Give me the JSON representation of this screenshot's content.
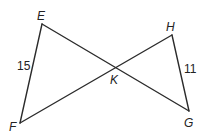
{
  "diagram": {
    "type": "two triangles sharing vertex K (bowtie)",
    "points": {
      "E": {
        "label": "E",
        "x": 42,
        "y": 24
      },
      "F": {
        "label": "F",
        "x": 20,
        "y": 123
      },
      "H": {
        "label": "H",
        "x": 172,
        "y": 35
      },
      "G": {
        "label": "G",
        "x": 189,
        "y": 111
      },
      "K": {
        "label": "K",
        "x": 115,
        "y": 67
      }
    },
    "segments": [
      {
        "from": "E",
        "to": "F",
        "length_label": "15"
      },
      {
        "from": "H",
        "to": "G",
        "length_label": "11"
      },
      {
        "from": "E",
        "to": "G",
        "length_label": ""
      },
      {
        "from": "F",
        "to": "H",
        "length_label": ""
      }
    ],
    "labels": {
      "E": "E",
      "F": "F",
      "G": "G",
      "H": "H",
      "K": "K",
      "EF": "15",
      "HG": "11"
    }
  }
}
